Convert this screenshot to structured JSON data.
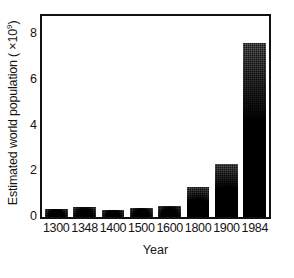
{
  "chart_data": {
    "type": "bar",
    "title": "",
    "subtitle": "",
    "xlabel": "Year",
    "ylabel_prefix": "Estimated world population ( ",
    "ylabel_times": "×",
    "ylabel_base": "10",
    "ylabel_exponent": "9",
    "ylabel_suffix": ")",
    "ylabel_full": "Estimated world population ( ×10⁹)",
    "categories": [
      "1300",
      "1348",
      "1400",
      "1500",
      "1600",
      "1800",
      "1900",
      "1984"
    ],
    "values": [
      0.35,
      0.45,
      0.32,
      0.4,
      0.5,
      1.3,
      2.3,
      7.6
    ],
    "ylim": [
      0,
      8.8
    ],
    "xlim_note": "categorical",
    "yticks": [
      "0",
      "2",
      "4",
      "6",
      "8"
    ],
    "ytick_values": [
      0,
      2,
      4,
      6,
      8
    ],
    "grid": false,
    "legend": false,
    "legend_position": "none",
    "bar_color": "#1a1a1a",
    "frame_color": "#111111",
    "background_color": "#ffffff",
    "annotations": []
  },
  "figure": {
    "frame_name": "plot-frame",
    "axis_line_color": "#111111"
  }
}
